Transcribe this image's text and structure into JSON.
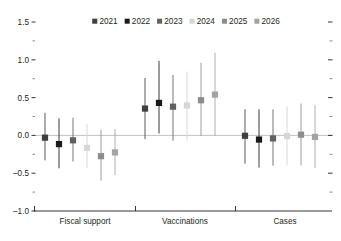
{
  "chart_data": {
    "type": "scatter",
    "title": "",
    "subtitle": "",
    "xlabel": "",
    "ylabel": "",
    "ylim": [
      -1.0,
      1.5
    ],
    "ytick_labels": [
      "1.5",
      "1.0",
      "0.5",
      "0.0",
      "-0.5",
      "-1.0"
    ],
    "ytick_values": [
      1.5,
      1.0,
      0.5,
      0.0,
      -0.5,
      -1.0
    ],
    "minor_ticks": [
      1.25,
      0.75,
      0.25,
      -0.25,
      -0.75
    ],
    "grid": false,
    "zero_line": true,
    "legend_position": "top-center",
    "categories": [
      "Fiscal support",
      "Vaccinations",
      "Cases"
    ],
    "series": [
      {
        "name": "2021",
        "color": "#3f3f3f",
        "values": [
          -0.03,
          0.355,
          -0.005
        ],
        "ci_low": [
          -0.33,
          -0.05,
          -0.375
        ],
        "ci_high": [
          0.3,
          0.76,
          0.345
        ]
      },
      {
        "name": "2022",
        "color": "#1a1a1a",
        "values": [
          -0.115,
          0.43,
          -0.055
        ],
        "ci_low": [
          -0.435,
          0.025,
          -0.425
        ],
        "ci_high": [
          0.225,
          0.985,
          0.345
        ]
      },
      {
        "name": "2023",
        "color": "#616161",
        "values": [
          -0.065,
          0.38,
          -0.04
        ],
        "ci_low": [
          -0.345,
          -0.07,
          -0.4
        ],
        "ci_high": [
          0.235,
          0.8,
          0.345
        ]
      },
      {
        "name": "2024",
        "color": "#d6d6d6",
        "values": [
          -0.165,
          0.395,
          -0.01
        ],
        "ci_low": [
          -0.43,
          -0.07,
          -0.395
        ],
        "ci_high": [
          0.155,
          0.845,
          0.385
        ]
      },
      {
        "name": "2025",
        "color": "#8c8c8c",
        "values": [
          -0.275,
          0.465,
          0.01
        ],
        "ci_low": [
          -0.6,
          -0.005,
          -0.395
        ],
        "ci_high": [
          0.075,
          0.96,
          0.42
        ]
      },
      {
        "name": "2026",
        "color": "#a3a3a3",
        "values": [
          -0.225,
          0.54,
          -0.02
        ],
        "ci_low": [
          -0.525,
          -0.005,
          -0.43
        ],
        "ci_high": [
          0.085,
          1.095,
          0.4
        ]
      }
    ]
  },
  "axis": {
    "left_tick_color": "#231f20",
    "right_tick_color": "#231f20",
    "baseline_color": "#231f20",
    "zero_line_color": "#b3b3b3"
  },
  "legend": {
    "items": [
      "2021",
      "2022",
      "2023",
      "2024",
      "2025",
      "2026"
    ]
  }
}
